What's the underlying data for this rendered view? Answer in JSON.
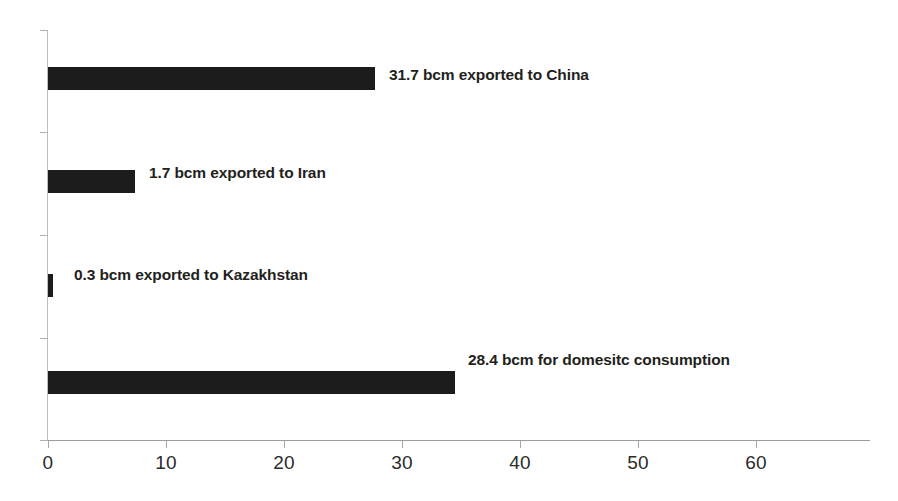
{
  "chart_data": {
    "type": "bar",
    "orientation": "horizontal",
    "title": "",
    "subtitle": "",
    "xlabel": "",
    "ylabel": "",
    "xlim": [
      0,
      69.8
    ],
    "ylim": [
      0,
      4
    ],
    "grid": false,
    "legend": null,
    "bar_color": "#1c1c1c",
    "axis_color": "#9c9c9c",
    "background": "#ffffff",
    "xticks": [
      0,
      10,
      20,
      30,
      40,
      50,
      60
    ],
    "xticklabels": [
      "0",
      "10",
      "20",
      "30",
      "40",
      "50",
      "60"
    ],
    "categories": [
      "exported to China",
      "exported to Iran",
      "exported to Kazakhstan",
      "for domesitc consumption"
    ],
    "values": [
      27.7,
      7.4,
      0.4,
      34.4
    ],
    "data_labels": [
      "31.7 bcm exported to China",
      "1.7 bcm exported to Iran",
      "0.3 bcm exported to Kazakhstan",
      "28.4 bcm for domesitc consumption"
    ],
    "stated_values": [
      31.7,
      1.7,
      0.3,
      28.4
    ],
    "units": "bcm"
  },
  "bars": [
    {
      "label": "31.7 bcm exported to China",
      "value": 27.7,
      "bar_left_px": 48,
      "bar_width_px": 327,
      "bar_top_px": 67,
      "label_left_px": 389,
      "label_top_px": 66
    },
    {
      "label": "1.7 bcm exported to Iran",
      "value": 7.4,
      "bar_left_px": 48,
      "bar_width_px": 87,
      "bar_top_px": 170,
      "label_left_px": 149,
      "label_top_px": 164
    },
    {
      "label": "0.3 bcm exported to Kazakhstan",
      "value": 0.4,
      "bar_left_px": 48,
      "bar_width_px": 5,
      "bar_top_px": 274,
      "label_left_px": 74,
      "label_top_px": 266
    },
    {
      "label": "28.4 bcm for domesitc consumption",
      "value": 34.4,
      "bar_left_px": 48,
      "bar_width_px": 407,
      "bar_top_px": 371,
      "label_left_px": 468,
      "label_top_px": 351
    }
  ],
  "axis": {
    "x_ticks": [
      {
        "label": "0",
        "left_px": 48
      },
      {
        "label": "10",
        "left_px": 166
      },
      {
        "label": "20",
        "left_px": 284
      },
      {
        "label": "30",
        "left_px": 402
      },
      {
        "label": "40",
        "left_px": 520
      },
      {
        "label": "50",
        "left_px": 638
      },
      {
        "label": "60",
        "left_px": 756
      }
    ],
    "y_ticks_top_px": [
      30,
      132,
      235,
      338,
      440
    ]
  }
}
